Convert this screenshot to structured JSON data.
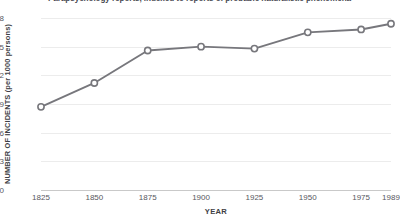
{
  "title": "Parapsychology reports, indexed to reports of probable naturalistic phenomena",
  "axes": {
    "ylabel": "NUMBER OF INCIDENTS (per 1000 persons)",
    "xlabel": "YEAR",
    "yticks": [
      "0",
      "0.3",
      "0.6",
      "0.9",
      "1.2",
      "1.5",
      "1.8"
    ],
    "xticks": [
      "1825",
      "1850",
      "1875",
      "1900",
      "1925",
      "1950",
      "1975",
      "1989"
    ]
  },
  "style": {
    "line_color": "#77777c",
    "marker_fill": "#ffffff",
    "grid_color": "#ececec",
    "axis_color": "#c9c9c9",
    "text_color": "#57575e"
  },
  "chart_data": {
    "type": "line",
    "title": "Parapsychology reports, indexed to reports of probable naturalistic phenomena",
    "xlabel": "YEAR",
    "ylabel": "NUMBER OF INCIDENTS (per 1000 persons)",
    "x": [
      1825,
      1850,
      1875,
      1900,
      1925,
      1950,
      1975,
      1989
    ],
    "categories": [
      "1825",
      "1850",
      "1875",
      "1900",
      "1925",
      "1950",
      "1975",
      "1989"
    ],
    "values": [
      0.87,
      1.12,
      1.46,
      1.5,
      1.48,
      1.65,
      1.68,
      1.74
    ],
    "series": [
      {
        "name": "Parapsychology reports",
        "values": [
          0.87,
          1.12,
          1.46,
          1.5,
          1.48,
          1.65,
          1.68,
          1.74
        ]
      }
    ],
    "ylim": [
      0,
      1.8
    ],
    "xlim": [
      1825,
      1989
    ],
    "yticks": [
      0,
      0.3,
      0.6,
      0.9,
      1.2,
      1.5,
      1.8
    ],
    "xticks": [
      1825,
      1850,
      1875,
      1900,
      1925,
      1950,
      1975,
      1989
    ],
    "grid": "horizontal",
    "legend": "none",
    "marker": "open-circle"
  }
}
